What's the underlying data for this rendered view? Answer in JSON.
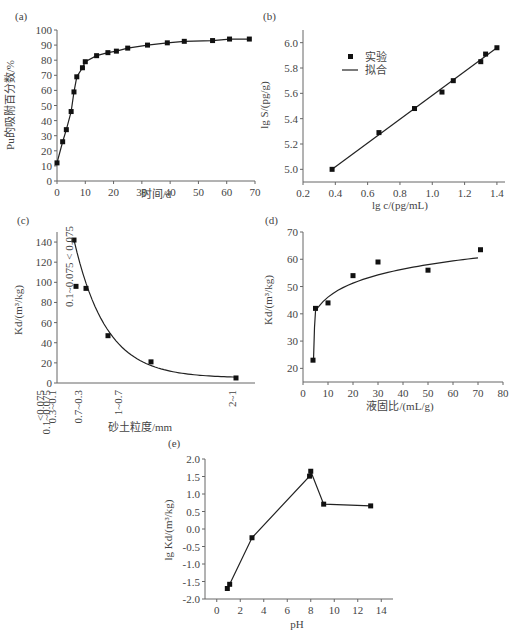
{
  "chart_data": [
    {
      "panel": "(a)",
      "type": "line",
      "title": "",
      "xlabel": "时间/d",
      "ylabel": "Pu的吸附百分数/%",
      "xlim": [
        0,
        70
      ],
      "ylim": [
        0,
        100
      ],
      "xticks": [
        0,
        10,
        20,
        30,
        40,
        50,
        60,
        70
      ],
      "yticks": [
        0,
        10,
        20,
        30,
        40,
        50,
        60,
        70,
        80,
        90,
        100
      ],
      "grid": false,
      "series": [
        {
          "name": "Pu adsorption",
          "marker": "square",
          "x": [
            0,
            2,
            3.3,
            5,
            6,
            7,
            9,
            10,
            14,
            18,
            21,
            25,
            32,
            39,
            45,
            55,
            61,
            68
          ],
          "y": [
            12,
            26,
            34,
            46,
            59,
            69,
            75,
            79,
            83,
            85,
            86,
            88,
            90,
            91.5,
            92.5,
            93,
            94,
            94
          ]
        }
      ]
    },
    {
      "panel": "(b)",
      "type": "scatter",
      "title": "",
      "xlabel": "lg c/(pg/mL)",
      "ylabel": "lg S/(pg/g)",
      "xlim": [
        0.2,
        1.45
      ],
      "ylim": [
        4.9,
        6.1
      ],
      "xticks": [
        0.2,
        0.4,
        0.6,
        0.8,
        1.0,
        1.2,
        1.4
      ],
      "yticks": [
        5.0,
        5.2,
        5.4,
        5.6,
        5.8,
        6.0
      ],
      "grid": false,
      "legend": {
        "position": "upper-left",
        "entries": [
          "实验",
          "拟合"
        ]
      },
      "series": [
        {
          "name": "实验",
          "marker": "square",
          "x": [
            0.38,
            0.67,
            0.89,
            1.06,
            1.13,
            1.3,
            1.33,
            1.4
          ],
          "y": [
            5.0,
            5.29,
            5.48,
            5.61,
            5.7,
            5.85,
            5.91,
            5.96
          ]
        },
        {
          "name": "拟合",
          "line": "solid",
          "x": [
            0.38,
            1.4
          ],
          "y": [
            5.0,
            5.96
          ]
        }
      ]
    },
    {
      "panel": "(c)",
      "type": "scatter",
      "title": "",
      "xlabel": "砂土粒度/mm",
      "ylabel": "Kd/(m³/kg)",
      "ylim": [
        0,
        150
      ],
      "yticks": [
        0,
        20,
        40,
        60,
        80,
        100,
        120,
        140
      ],
      "grid": false,
      "categories": [
        "<0.075",
        "0.1~0.075",
        "0.3~0.1",
        "0.7~0.3",
        "1~0.7",
        "2~1"
      ],
      "annotation": "0.1~0.075  <0.075",
      "series": [
        {
          "name": "Kd",
          "marker": "square",
          "x_pos": [
            0,
            0.05,
            0.35,
            1.0,
            2.3,
            4.8
          ],
          "y": [
            142,
            96,
            94,
            47,
            21,
            5
          ]
        },
        {
          "name": "fit",
          "line": "solid",
          "shape": "exponential decay"
        }
      ]
    },
    {
      "panel": "(d)",
      "type": "scatter",
      "title": "",
      "xlabel": "液固比/(mL/g)",
      "ylabel": "Kd/(m³/kg)",
      "xlim": [
        0,
        80
      ],
      "ylim": [
        15,
        70
      ],
      "xticks": [
        0,
        10,
        20,
        30,
        40,
        50,
        60,
        70,
        80
      ],
      "yticks": [
        20,
        30,
        40,
        50,
        60,
        70
      ],
      "grid": false,
      "series": [
        {
          "name": "Kd",
          "marker": "square",
          "x": [
            4,
            5,
            10,
            20,
            30,
            50,
            71
          ],
          "y": [
            23,
            42,
            44,
            54,
            59,
            56,
            63.5
          ]
        },
        {
          "name": "fit",
          "line": "solid",
          "shape": "logarithmic"
        }
      ]
    },
    {
      "panel": "(e)",
      "type": "line",
      "title": "",
      "xlabel": "pH",
      "ylabel": "lg Kd/(m³/kg)",
      "xlim": [
        -1,
        15
      ],
      "ylim": [
        -2.0,
        2.0
      ],
      "xticks": [
        0,
        2,
        4,
        6,
        8,
        10,
        12,
        14
      ],
      "yticks": [
        -2.0,
        -1.5,
        -1.0,
        -0.5,
        0.0,
        0.5,
        1.0,
        1.5,
        2.0
      ],
      "grid": false,
      "series": [
        {
          "name": "lg Kd",
          "marker": "square",
          "x": [
            0.9,
            1.1,
            3.0,
            7.9,
            8.0,
            9.1,
            13.1
          ],
          "y": [
            -1.7,
            -1.58,
            -0.25,
            1.51,
            1.65,
            0.71,
            0.66
          ]
        }
      ]
    }
  ],
  "labels": {
    "a": {
      "panel": "(a)",
      "xlabel": "时间/d",
      "ylabel": "Pu的吸附百分数/%"
    },
    "b": {
      "panel": "(b)",
      "xlabel": "lg c/(pg/mL)",
      "ylabel": "lg S/(pg/g)",
      "legend_exp": "实验",
      "legend_fit": "拟合"
    },
    "c": {
      "panel": "(c)",
      "xlabel": "砂土粒度/mm",
      "ylabel": "Kd/(m³/kg)",
      "annotation": "0.1~0.075  < 0.075"
    },
    "d": {
      "panel": "(d)",
      "xlabel": "液固比/(mL/g)",
      "ylabel": "Kd/(m³/kg)"
    },
    "e": {
      "panel": "(e)",
      "xlabel": "pH",
      "ylabel": "lg Kd/(m³/kg)"
    }
  }
}
